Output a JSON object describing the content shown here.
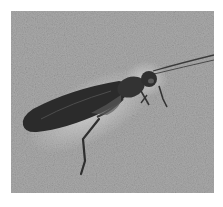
{
  "image": {
    "subject": "fossil insect on stone slab",
    "style": "grayscale photograph",
    "colors": {
      "background": "#ffffff",
      "stone": "#a9a9a9",
      "stone_light": "#c2c2c2",
      "insect_dark": "#2b2b2b",
      "insect_mid": "#4a4a4a"
    }
  }
}
